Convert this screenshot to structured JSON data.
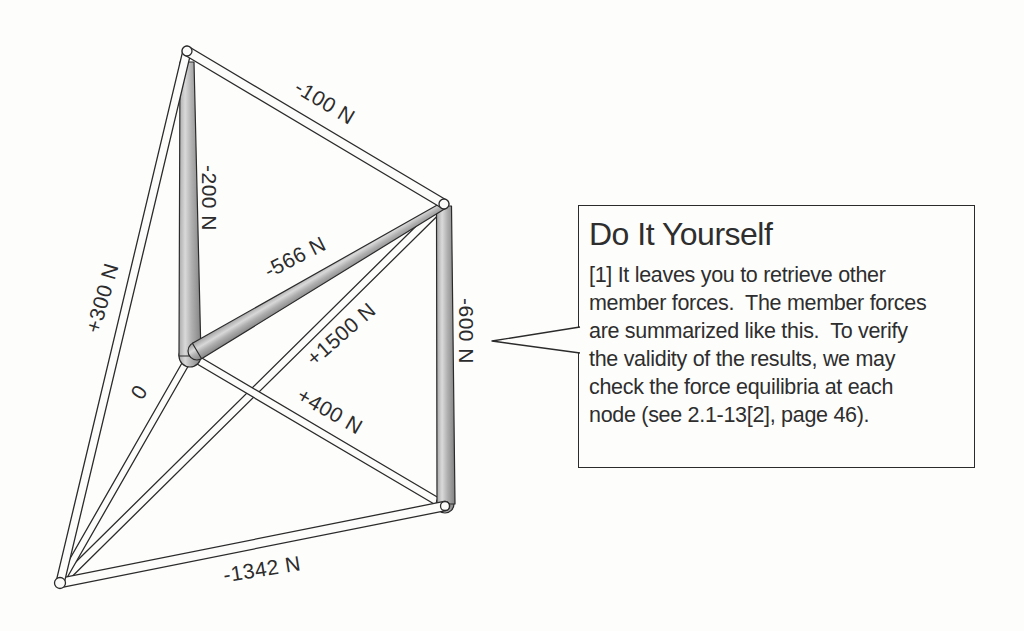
{
  "truss": {
    "member_labels": [
      {
        "member": "top-right-chord",
        "text": "-100 N"
      },
      {
        "member": "upper-vertical",
        "text": "-200 N"
      },
      {
        "member": "upper-diagonal",
        "text": "-566 N"
      },
      {
        "member": "left-chord",
        "text": "+300 N"
      },
      {
        "member": "inner-left-member",
        "text": "0"
      },
      {
        "member": "long-diagonal",
        "text": "+1500 N"
      },
      {
        "member": "lower-diagonal",
        "text": "+400 N"
      },
      {
        "member": "bottom-chord",
        "text": "-1342 N"
      },
      {
        "member": "right-vertical",
        "text": "-600 N"
      }
    ]
  },
  "callout": {
    "title": "Do It Yourself",
    "body_lines": [
      "[1] It leaves you to retrieve other",
      "member forces.  The member forces",
      "are summarized like this.  To verify",
      "the validity of the results, we may",
      "check the force equilibria at each",
      "node (see 2.1-13[2], page 46)."
    ]
  },
  "colors": {
    "ink": "#2b2b2b",
    "paper": "#fdfdfc",
    "tube_white": "#fcfcfb",
    "shade_gray": "#9c9c9c"
  }
}
